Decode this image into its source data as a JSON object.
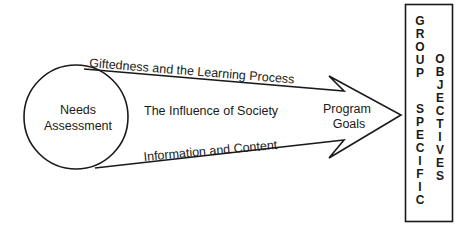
{
  "diagram": {
    "source_node": {
      "label_line1": "Needs",
      "label_line2": "Assessment"
    },
    "arrow_labels": {
      "top": "Giftedness and the Learning Process",
      "middle": "The Influence of Society",
      "bottom": "Information and Content"
    },
    "arrow_head_label": {
      "line1": "Program",
      "line2": "Goals"
    },
    "target_box": {
      "column1_letters": [
        "G",
        "R",
        "O",
        "U",
        "P",
        "",
        "S",
        "P",
        "E",
        "C",
        "I",
        "F",
        "I",
        "C"
      ],
      "column2_letters": [
        "O",
        "B",
        "J",
        "E",
        "C",
        "T",
        "I",
        "V",
        "E",
        "S"
      ],
      "column1_words": [
        "GROUP",
        "SPECIFIC"
      ],
      "column2_words": [
        "OBJECTIVES"
      ]
    },
    "colors": {
      "stroke": "#1a1a1a",
      "background": "#ffffff"
    }
  }
}
